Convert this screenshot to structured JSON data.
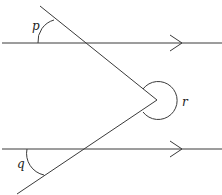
{
  "diagram": {
    "type": "parallel-lines-angles",
    "labels": {
      "p": "p",
      "q": "q",
      "r": "r"
    },
    "colors": {
      "stroke": "#3a3a3a",
      "text": "#222222",
      "background": "#ffffff"
    }
  }
}
